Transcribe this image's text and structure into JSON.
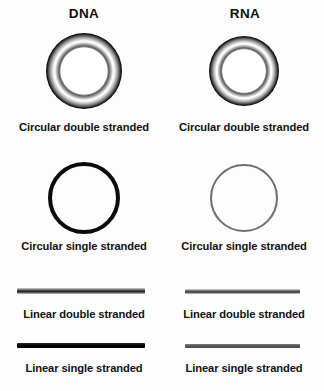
{
  "figure": {
    "background_color": "#ffffff",
    "columns": [
      {
        "id": "dna",
        "title": "DNA",
        "rows": [
          {
            "id": "circular-double-stranded",
            "caption": "Circular double stranded",
            "shape": "torus-ring",
            "color": "#000000"
          },
          {
            "id": "circular-single-stranded",
            "caption": "Circular single stranded",
            "shape": "thick-ring",
            "color": "#0b0b0b"
          },
          {
            "id": "linear-double-stranded",
            "caption": "Linear double stranded",
            "shape": "shaded-bar",
            "color": "#262626"
          },
          {
            "id": "linear-single-stranded",
            "caption": "Linear single stranded",
            "shape": "solid-bar",
            "color": "#000000"
          }
        ]
      },
      {
        "id": "rna",
        "title": "RNA",
        "rows": [
          {
            "id": "circular-double-stranded",
            "caption": "Circular double stranded",
            "shape": "torus-ring",
            "color": "#000000"
          },
          {
            "id": "circular-single-stranded",
            "caption": "Circular single stranded",
            "shape": "thin-ring",
            "color": "#6e6e6e"
          },
          {
            "id": "linear-double-stranded",
            "caption": "Linear double stranded",
            "shape": "shaded-bar",
            "color": "#3a3a3a"
          },
          {
            "id": "linear-single-stranded",
            "caption": "Linear single stranded",
            "shape": "solid-bar",
            "color": "#565656"
          }
        ]
      }
    ]
  }
}
